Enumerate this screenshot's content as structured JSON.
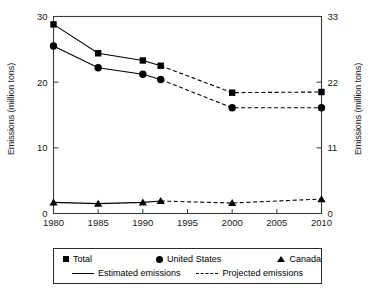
{
  "chart_data": {
    "type": "line",
    "title": "",
    "xlabel": "",
    "ylabel": "Emissions (million tons)",
    "ylabel_right": "Emissions (million tons)",
    "x": [
      1980,
      1985,
      1990,
      1992,
      2000,
      2010
    ],
    "xlim": [
      1980,
      2010
    ],
    "ylim": [
      0,
      30
    ],
    "ylim_right": [
      0,
      33
    ],
    "xticks": [
      "1980",
      "1985",
      "1990",
      "1995",
      "2000",
      "2005",
      "2010"
    ],
    "xtick_values": [
      1980,
      1985,
      1990,
      1995,
      2000,
      2005,
      2010
    ],
    "yticks_left": [
      "0",
      "10",
      "20",
      "30"
    ],
    "ytick_values_left": [
      0,
      10,
      20,
      30
    ],
    "yticks_right": [
      "0",
      "11",
      "22",
      "33"
    ],
    "ytick_values_right": [
      0,
      11,
      22,
      33
    ],
    "grid": false,
    "legend_position": "below",
    "series": [
      {
        "name": "Total",
        "marker": "square",
        "x": [
          1980,
          1985,
          1990,
          1992,
          2000,
          2010
        ],
        "values": [
          28.8,
          24.4,
          23.3,
          22.5,
          18.4,
          18.5
        ],
        "estimated_through": 1992
      },
      {
        "name": "United States",
        "marker": "circle",
        "x": [
          1980,
          1985,
          1990,
          1992,
          2000,
          2010
        ],
        "values": [
          25.5,
          22.2,
          21.2,
          20.4,
          16.1,
          16.1
        ],
        "estimated_through": 1992
      },
      {
        "name": "Canada",
        "marker": "triangle",
        "x": [
          1980,
          1985,
          1990,
          1992,
          2000,
          2010
        ],
        "values": [
          1.7,
          1.5,
          1.7,
          1.9,
          1.6,
          2.2
        ],
        "estimated_through": 1992
      }
    ],
    "line_styles": [
      {
        "label": "Estimated emissions",
        "style": "solid"
      },
      {
        "label": "Projected emissions",
        "style": "dashed"
      }
    ]
  },
  "legend": {
    "total_label": "Total",
    "united_states_label": "United States",
    "canada_label": "Canada",
    "estimated_label": "Estimated emissions",
    "projected_label": "Projected emissions"
  },
  "axes": {
    "left_title": "Emissions (million tons)",
    "right_title": "Emissions (million tons)"
  },
  "colors": {
    "line": "#000000",
    "marker": "#000000",
    "frame": "#3a3a3a",
    "background": "#ffffff"
  }
}
